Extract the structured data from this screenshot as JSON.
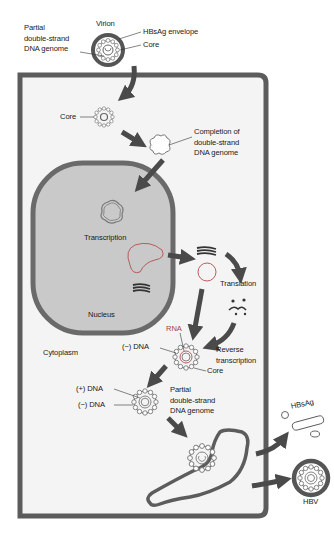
{
  "colors": {
    "cell_border": "#5c5c5c",
    "cytoplasm": "#f4f4f4",
    "nucleus_fill": "#c9c9c9",
    "nucleus_border": "#6a6a6a",
    "arrow": "#4a4a4a",
    "core_outline": "#777777",
    "rna": "#b05050",
    "text": "#1a1a1a"
  },
  "labels": {
    "virion": "Virion",
    "hbsag_envelope": "HBsAg envelope",
    "core_top": "Core",
    "partial_genome_top": "Partial\ndouble-strand\nDNA genome",
    "core_cytoplasm": "Core",
    "completion": "Completion of\ndouble-strand\nDNA genome",
    "transcription": "Transcription",
    "nucleus": "Nucleus",
    "translation": "Translation",
    "cytoplasm": "Cytoplasm",
    "rna": "RNA",
    "minus_dna_1": "(−) DNA",
    "reverse_transcription": "Reverse\ntranscription",
    "core_rt": "Core",
    "plus_dna": "(+) DNA",
    "minus_dna_2": "(−) DNA",
    "partial_genome_bottom": "Partial\ndouble-strand\nDNA genome",
    "hbsag": "HBsAg",
    "hbv": "HBV"
  }
}
